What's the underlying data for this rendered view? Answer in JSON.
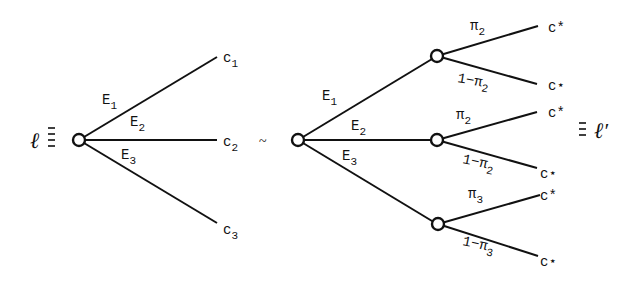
{
  "left_lottery": {
    "name": "ℓ",
    "equiv": "≡",
    "branches": [
      {
        "event": "E",
        "event_sub": "1",
        "outcome": "c",
        "outcome_sub": "1"
      },
      {
        "event": "E",
        "event_sub": "2",
        "outcome": "c",
        "outcome_sub": "2"
      },
      {
        "event": "E",
        "event_sub": "3",
        "outcome": "c",
        "outcome_sub": "3"
      }
    ]
  },
  "relation": "~",
  "right_lottery": {
    "name": "ℓ′",
    "equiv": "≡",
    "branches": [
      {
        "event": "E",
        "event_sub": "1",
        "sub": [
          {
            "prob": "π",
            "prob_sub": "2",
            "outcome": "c*"
          },
          {
            "prob": "1−π",
            "prob_sub": "2",
            "outcome": "c⋆"
          }
        ]
      },
      {
        "event": "E",
        "event_sub": "2",
        "sub": [
          {
            "prob": "π",
            "prob_sub": "2",
            "outcome": "c*"
          },
          {
            "prob": "1−π",
            "prob_sub": "2",
            "outcome": "c⋆"
          }
        ]
      },
      {
        "event": "E",
        "event_sub": "3",
        "sub": [
          {
            "prob": "π",
            "prob_sub": "3",
            "outcome": "c*"
          },
          {
            "prob": "1−π",
            "prob_sub": "3",
            "outcome": "c⋆"
          }
        ]
      }
    ]
  }
}
